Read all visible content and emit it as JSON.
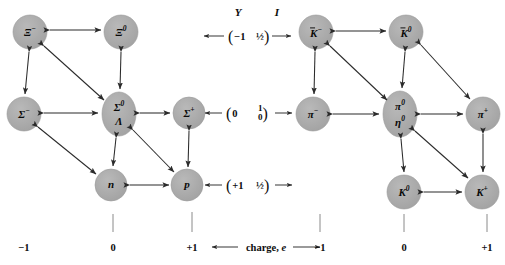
{
  "figure": {
    "background_color": "#ffffff",
    "node_fill": "#a8a8a8",
    "node_stroke": "#8f8f8f",
    "arrow_color": "#2b2b2b",
    "text_color": "#0d0d0d"
  },
  "left_octet": {
    "name": "baryon-octet",
    "nodes": [
      {
        "id": "xi-minus",
        "symbol": "Ξ",
        "superscript": "−",
        "overline": false,
        "x": 30,
        "y": 32,
        "shape": "circle"
      },
      {
        "id": "xi-zero",
        "symbol": "Ξ",
        "superscript": "0",
        "overline": false,
        "x": 121,
        "y": 32,
        "shape": "circle"
      },
      {
        "id": "sigma-minus",
        "symbol": "Σ",
        "superscript": "−",
        "overline": false,
        "x": 24,
        "y": 114,
        "shape": "circle"
      },
      {
        "id": "sigma-zero-lambda",
        "symbol": "Σ",
        "superscript": "0",
        "symbol2": "Λ",
        "overline": false,
        "x": 119,
        "y": 114,
        "shape": "ellipse"
      },
      {
        "id": "sigma-plus",
        "symbol": "Σ",
        "superscript": "+",
        "overline": false,
        "x": 189,
        "y": 113,
        "shape": "circle"
      },
      {
        "id": "neutron",
        "symbol": "n",
        "superscript": "",
        "overline": false,
        "x": 111,
        "y": 185,
        "shape": "circle"
      },
      {
        "id": "proton",
        "symbol": "p",
        "superscript": "",
        "overline": false,
        "x": 187,
        "y": 185,
        "shape": "circle"
      }
    ],
    "x_axis_ticks": [
      {
        "label": "−1",
        "x": 24
      },
      {
        "label": "0",
        "x": 113
      },
      {
        "label": "+1",
        "x": 192
      }
    ]
  },
  "right_octet": {
    "name": "meson-octet",
    "nodes": [
      {
        "id": "kbar-minus",
        "symbol": "K",
        "superscript": "−",
        "overline": true,
        "x": 316,
        "y": 32,
        "shape": "circle"
      },
      {
        "id": "kbar-zero",
        "symbol": "K",
        "superscript": "0",
        "overline": true,
        "x": 406,
        "y": 32,
        "shape": "circle"
      },
      {
        "id": "pi-minus",
        "symbol": "π",
        "superscript": "−",
        "overline": false,
        "x": 313,
        "y": 114,
        "shape": "circle"
      },
      {
        "id": "pi-zero-eta-zero",
        "symbol": "π",
        "superscript": "0",
        "symbol2": "η",
        "superscript2": "0",
        "overline": false,
        "x": 400,
        "y": 114,
        "shape": "ellipse"
      },
      {
        "id": "pi-plus",
        "symbol": "π",
        "superscript": "+",
        "overline": false,
        "x": 483,
        "y": 114,
        "shape": "circle"
      },
      {
        "id": "k-zero",
        "symbol": "K",
        "superscript": "0",
        "overline": false,
        "x": 404,
        "y": 192,
        "shape": "circle"
      },
      {
        "id": "k-plus",
        "symbol": "K",
        "superscript": "+",
        "overline": false,
        "x": 482,
        "y": 192,
        "shape": "circle"
      }
    ],
    "x_axis_ticks": [
      {
        "label": "−1",
        "x": 320
      },
      {
        "label": "0",
        "x": 404
      },
      {
        "label": "+1",
        "x": 487
      }
    ]
  },
  "axes": {
    "y_header": "Y",
    "i_header": "I",
    "charge_label_text": "charge,",
    "charge_label_italic": "e",
    "rows": [
      {
        "y_value": "−1",
        "i_value": "½",
        "i_is_fraction": false,
        "y_pixel": 36
      },
      {
        "y_value": "0",
        "i_value_num": "1",
        "i_value_den": "0",
        "i_is_fraction": true,
        "y_pixel": 114
      },
      {
        "y_value": "+1",
        "i_value": "½",
        "i_is_fraction": false,
        "y_pixel": 185
      }
    ]
  }
}
